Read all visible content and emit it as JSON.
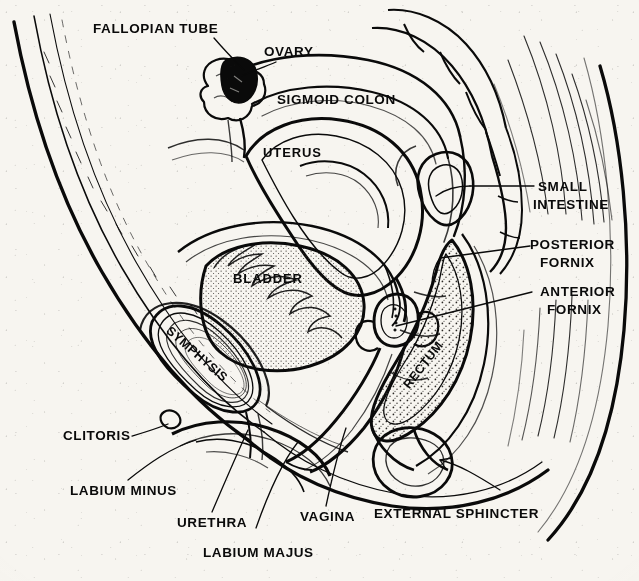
{
  "figure": {
    "ink_color": "#0a0a0a",
    "paper_color": "#f7f5f0",
    "stipple_color": "#2a2724"
  },
  "labels": {
    "fallopian_tube": "FALLOPIAN TUBE",
    "ovary": "OVARY",
    "sigmoid_colon": "SIGMOID COLON",
    "uterus": "UTERUS",
    "small_intestine_l1": "SMALL",
    "small_intestine_l2": "INTESTINE",
    "posterior_fornix_l1": "POSTERIOR",
    "posterior_fornix_l2": "FORNIX",
    "anterior_fornix_l1": "ANTERIOR",
    "anterior_fornix_l2": "FORNIX",
    "bladder": "BLADDER",
    "symphysis": "SYMPHYSIS",
    "rectum": "RECTUM",
    "clitoris": "CLITORIS",
    "labium_minus": "LABIUM MINUS",
    "urethra": "URETHRA",
    "labium_majus": "LABIUM MAJUS",
    "vagina": "VAGINA",
    "external_sphincter": "EXTERNAL SPHINCTER"
  },
  "structures": [
    {
      "name": "abdominal-wall",
      "kind": "outline"
    },
    {
      "name": "sacrum-vertebrae",
      "kind": "bone"
    },
    {
      "name": "symphysis-pubis",
      "kind": "bone"
    },
    {
      "name": "urinary-bladder",
      "kind": "organ"
    },
    {
      "name": "uterus-body",
      "kind": "organ"
    },
    {
      "name": "ovary",
      "kind": "organ"
    },
    {
      "name": "fallopian-tube",
      "kind": "organ"
    },
    {
      "name": "sigmoid-colon",
      "kind": "organ"
    },
    {
      "name": "small-intestine",
      "kind": "organ"
    },
    {
      "name": "rectum",
      "kind": "organ"
    },
    {
      "name": "vaginal-canal",
      "kind": "organ"
    },
    {
      "name": "urethra",
      "kind": "organ"
    },
    {
      "name": "anal-canal",
      "kind": "organ"
    },
    {
      "name": "external-anal-sphincter",
      "kind": "muscle"
    },
    {
      "name": "labium-majus",
      "kind": "soft-tissue"
    },
    {
      "name": "labium-minus",
      "kind": "soft-tissue"
    },
    {
      "name": "clitoris",
      "kind": "soft-tissue"
    },
    {
      "name": "posterior-fornix",
      "kind": "landmark"
    },
    {
      "name": "anterior-fornix",
      "kind": "landmark"
    },
    {
      "name": "perineal-body",
      "kind": "soft-tissue"
    },
    {
      "name": "buttock-contour",
      "kind": "outline"
    }
  ]
}
